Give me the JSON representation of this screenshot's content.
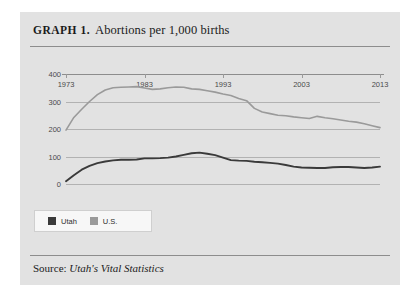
{
  "figure": {
    "label": "GRAPH 1.",
    "title": "Abortions per 1,000 births",
    "source_prefix": "Source:",
    "source_publication": "Utah's Vital Statistics"
  },
  "legend": {
    "position": "below-plot-left",
    "entries": [
      {
        "label": "Utah",
        "color": "#3a3a3a"
      },
      {
        "label": "U.S.",
        "color": "#9a9a9a"
      }
    ]
  },
  "colors": {
    "card_background": "#e2e2e2",
    "page_background": "#ffffff",
    "rule": "#8d8d8d",
    "gridline": "#b2b2b2",
    "utah_line": "#3a3a3a",
    "us_line": "#9a9a9a",
    "tick_text": "#4a4a4a",
    "title_text": "#1b1b1b"
  },
  "chart_data": {
    "type": "line",
    "title": "Abortions per 1,000 births",
    "xlabel": "",
    "ylabel": "",
    "xlim": [
      1973,
      2013
    ],
    "ylim": [
      0,
      400
    ],
    "yticks": [
      0,
      100,
      200,
      300,
      400
    ],
    "ytick_labels": [
      "0",
      "100",
      "200",
      "300",
      "400"
    ],
    "xticks": [
      1973,
      1983,
      1993,
      2003,
      2013
    ],
    "xtick_labels": [
      "1973",
      "1983",
      "1993",
      "2003",
      "2013"
    ],
    "grid": true,
    "grid_axis": "y",
    "legend": [
      "Utah",
      "U.S."
    ],
    "x": [
      1973,
      1974,
      1975,
      1976,
      1977,
      1978,
      1979,
      1980,
      1981,
      1982,
      1983,
      1984,
      1985,
      1986,
      1987,
      1988,
      1989,
      1990,
      1991,
      1992,
      1993,
      1994,
      1995,
      1996,
      1997,
      1998,
      1999,
      2000,
      2001,
      2002,
      2003,
      2004,
      2005,
      2006,
      2007,
      2008,
      2009,
      2010,
      2011,
      2012,
      2013
    ],
    "series": [
      {
        "name": "U.S.",
        "color": "#9a9a9a",
        "values": [
          196,
          242,
          272,
          300,
          325,
          342,
          350,
          352,
          353,
          354,
          349,
          344,
          346,
          350,
          353,
          352,
          346,
          344,
          339,
          334,
          327,
          322,
          311,
          303,
          275,
          262,
          256,
          250,
          248,
          244,
          241,
          238,
          246,
          241,
          237,
          233,
          228,
          225,
          219,
          212,
          205
        ]
      },
      {
        "name": "Utah",
        "color": "#3a3a3a",
        "values": [
          10,
          32,
          52,
          66,
          76,
          82,
          86,
          88,
          88,
          89,
          93,
          93,
          94,
          96,
          100,
          106,
          112,
          114,
          110,
          105,
          96,
          87,
          85,
          84,
          81,
          79,
          77,
          74,
          69,
          63,
          60,
          59,
          58,
          58,
          61,
          62,
          62,
          60,
          58,
          60,
          63
        ]
      }
    ]
  }
}
